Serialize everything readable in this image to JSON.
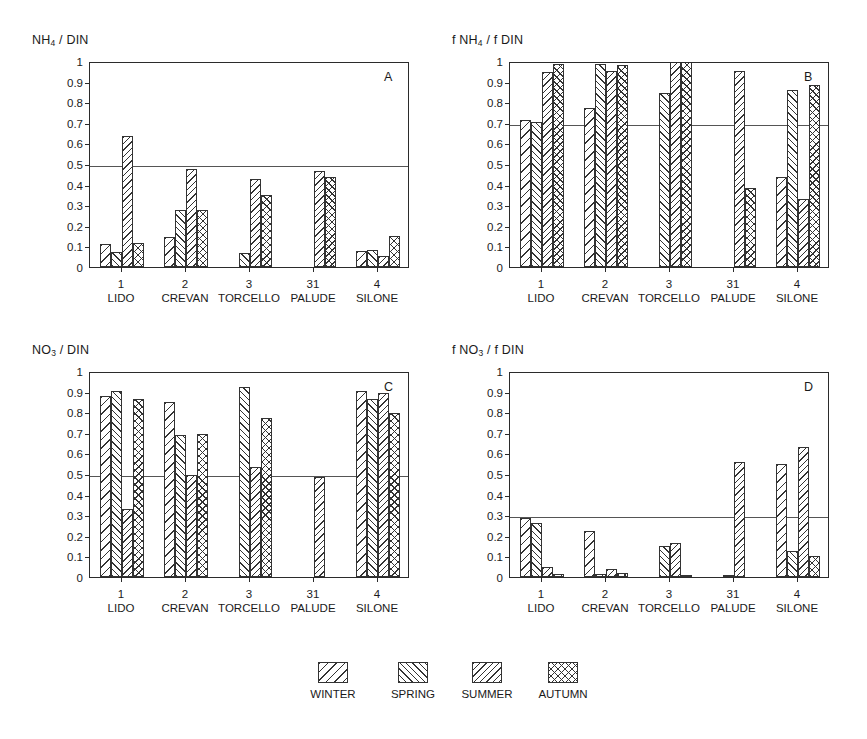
{
  "figure": {
    "legend": {
      "items": [
        {
          "key": "winter",
          "label": "WINTER",
          "pattern": "diagonal-backslash-sparse"
        },
        {
          "key": "spring",
          "label": "SPRING",
          "pattern": "diagonal-forwardslash-dense"
        },
        {
          "key": "summer",
          "label": "SUMMER",
          "pattern": "diagonal-backslash-wide"
        },
        {
          "key": "autumn",
          "label": "AUTUMN",
          "pattern": "crosshatch"
        }
      ]
    },
    "sites": [
      {
        "num": "1",
        "name": "LIDO"
      },
      {
        "num": "2",
        "name": "CREVAN"
      },
      {
        "num": "3",
        "name": "TORCELLO"
      },
      {
        "num": "31",
        "name": "PALUDE"
      },
      {
        "num": "4",
        "name": "SILONE"
      }
    ],
    "yticks": [
      "0",
      "0.1",
      "0.2",
      "0.3",
      "0.4",
      "0.5",
      "0.6",
      "0.7",
      "0.8",
      "0.9",
      "1"
    ]
  },
  "chart_data": [
    {
      "type": "bar",
      "panel": "A",
      "title": "NH4 / DIN",
      "title_html": "NH<sub>4</sub> / DIN",
      "xlabel": "",
      "ylabel": "NH4 / DIN",
      "ylim": [
        0,
        1
      ],
      "yticks": [
        0,
        0.1,
        0.2,
        0.3,
        0.4,
        0.5,
        0.6,
        0.7,
        0.8,
        0.9,
        1
      ],
      "grid": false,
      "threshold": 0.5,
      "legend_position": "below-figure",
      "categories": [
        "1 LIDO",
        "2 CREVAN",
        "3 TORCELLO",
        "31 PALUDE",
        "4 SILONE"
      ],
      "series": [
        {
          "name": "WINTER",
          "values": [
            0.11,
            0.145,
            0.0,
            null,
            0.08
          ]
        },
        {
          "name": "SPRING",
          "values": [
            0.075,
            0.275,
            0.07,
            null,
            0.085
          ]
        },
        {
          "name": "SUMMER",
          "values": [
            0.635,
            0.475,
            0.425,
            0.465,
            0.055
          ]
        },
        {
          "name": "AUTUMN",
          "values": [
            0.115,
            0.275,
            0.35,
            0.435,
            0.15
          ]
        }
      ]
    },
    {
      "type": "bar",
      "panel": "B",
      "title": "f NH4 / f DIN",
      "title_html": "f NH<sub>4</sub> / f DIN",
      "xlabel": "",
      "ylabel": "f NH4 / f DIN",
      "ylim": [
        0,
        1
      ],
      "yticks": [
        0,
        0.1,
        0.2,
        0.3,
        0.4,
        0.5,
        0.6,
        0.7,
        0.8,
        0.9,
        1
      ],
      "grid": false,
      "threshold": 0.7,
      "legend_position": "below-figure",
      "categories": [
        "1 LIDO",
        "2 CREVAN",
        "3 TORCELLO",
        "31 PALUDE",
        "4 SILONE"
      ],
      "series": [
        {
          "name": "WINTER",
          "values": [
            0.715,
            0.77,
            0.0,
            null,
            0.435
          ]
        },
        {
          "name": "SPRING",
          "values": [
            0.705,
            0.985,
            0.845,
            null,
            0.86
          ]
        },
        {
          "name": "SUMMER",
          "values": [
            0.945,
            0.95,
            1.0,
            0.95,
            0.33
          ]
        },
        {
          "name": "AUTUMN",
          "values": [
            0.985,
            0.98,
            1.0,
            0.385,
            0.885
          ]
        }
      ]
    },
    {
      "type": "bar",
      "panel": "C",
      "title": "NO3 / DIN",
      "title_html": "NO<sub>3</sub> / DIN",
      "xlabel": "",
      "ylabel": "NO3 / DIN",
      "ylim": [
        0,
        1
      ],
      "yticks": [
        0,
        0.1,
        0.2,
        0.3,
        0.4,
        0.5,
        0.6,
        0.7,
        0.8,
        0.9,
        1
      ],
      "grid": false,
      "threshold": 0.5,
      "legend_position": "below-figure",
      "categories": [
        "1 LIDO",
        "2 CREVAN",
        "3 TORCELLO",
        "31 PALUDE",
        "4 SILONE"
      ],
      "series": [
        {
          "name": "WINTER",
          "values": [
            0.88,
            0.85,
            0.0,
            null,
            0.905
          ]
        },
        {
          "name": "SPRING",
          "values": [
            0.905,
            0.69,
            0.92,
            null,
            0.865
          ]
        },
        {
          "name": "SUMMER",
          "values": [
            0.33,
            0.495,
            0.535,
            0.485,
            0.895
          ]
        },
        {
          "name": "AUTUMN",
          "values": [
            0.865,
            0.695,
            0.77,
            0.0,
            0.795
          ]
        }
      ]
    },
    {
      "type": "bar",
      "panel": "D",
      "title": "f NO3 / f DIN",
      "title_html": "f NO<sub>3</sub> / f DIN",
      "xlabel": "",
      "ylabel": "f NO3 / f DIN",
      "ylim": [
        0,
        1
      ],
      "yticks": [
        0,
        0.1,
        0.2,
        0.3,
        0.4,
        0.5,
        0.6,
        0.7,
        0.8,
        0.9,
        1
      ],
      "grid": false,
      "threshold": 0.3,
      "legend_position": "below-figure",
      "categories": [
        "1 LIDO",
        "2 CREVAN",
        "3 TORCELLO",
        "31 PALUDE",
        "4 SILONE"
      ],
      "series": [
        {
          "name": "WINTER",
          "values": [
            0.285,
            0.225,
            0.0,
            null,
            0.55
          ]
        },
        {
          "name": "SPRING",
          "values": [
            0.26,
            0.015,
            0.15,
            0.01,
            0.125
          ]
        },
        {
          "name": "SUMMER",
          "values": [
            0.05,
            0.04,
            0.165,
            0.56,
            0.63
          ]
        },
        {
          "name": "AUTUMN",
          "values": [
            0.015,
            0.02,
            0.01,
            0.0,
            0.1
          ]
        }
      ]
    }
  ]
}
